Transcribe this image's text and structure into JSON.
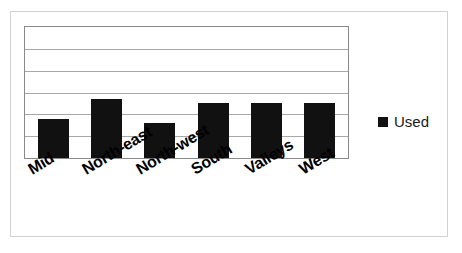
{
  "chart_data": {
    "type": "bar",
    "title": "",
    "subtitle": "",
    "xlabel": "",
    "ylabel": "",
    "categories": [
      "Mid",
      "North-east",
      "North-west",
      "South",
      "Valleys",
      "West"
    ],
    "series": [
      {
        "name": "Used",
        "color": "#111111",
        "values": [
          30,
          45,
          27,
          42,
          42,
          42
        ]
      }
    ],
    "ylim": [
      0,
      100
    ],
    "y_tick_values": [
      0,
      16.7,
      33.3,
      50,
      66.7,
      83.3,
      100
    ],
    "y_tick_labels": [],
    "grid": true,
    "grid_axis": "y",
    "grid_line_count": 5,
    "legend": {
      "position": "right",
      "entries": [
        {
          "label": "Used",
          "marker": "square",
          "color": "#111111"
        }
      ]
    },
    "axis_label_rotation": -31,
    "plot_border_color": "#8a8a8a",
    "grid_color": "#a8a8a8",
    "frame_color": "#d2d2d2",
    "background": "#ffffff"
  }
}
